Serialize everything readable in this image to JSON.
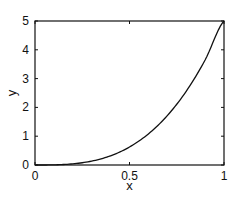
{
  "chart_data": {
    "type": "line",
    "title": "",
    "xlabel": "x",
    "ylabel": "y",
    "xlim": [
      0,
      1
    ],
    "ylim": [
      0,
      5
    ],
    "xticks": [
      0,
      0.5,
      1
    ],
    "xtick_labels": [
      "0",
      "0.5",
      "1"
    ],
    "yticks": [
      0,
      1,
      2,
      3,
      4,
      5
    ],
    "ytick_labels": [
      "0",
      "1",
      "2",
      "3",
      "4",
      "5"
    ],
    "grid": false,
    "legend": null,
    "series": [
      {
        "name": "y = 5x^3",
        "color": "#111111",
        "x": [
          0,
          0.1,
          0.2,
          0.3,
          0.4,
          0.5,
          0.6,
          0.7,
          0.8,
          0.9,
          1.0
        ],
        "y": [
          0,
          0.005,
          0.04,
          0.135,
          0.32,
          0.625,
          1.08,
          1.715,
          2.56,
          3.645,
          5.0
        ]
      }
    ]
  }
}
